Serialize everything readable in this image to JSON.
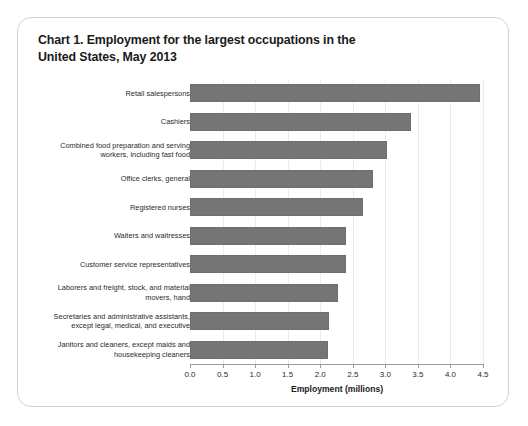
{
  "card": {
    "title_line1": "Chart 1. Employment for the largest occupations in the",
    "title_line2": "United States, May 2013"
  },
  "chart_data": {
    "type": "bar",
    "orientation": "horizontal",
    "title": "Chart 1. Employment for the largest occupations in the United States, May 2013",
    "xlabel": "Employment (millions)",
    "ylabel": "",
    "xlim": [
      0.0,
      4.5
    ],
    "xticks": [
      "0.0",
      "0.5",
      "1.0",
      "1.5",
      "2.0",
      "2.5",
      "3.0",
      "3.5",
      "4.0",
      "4.5"
    ],
    "xtick_values": [
      0.0,
      0.5,
      1.0,
      1.5,
      2.0,
      2.5,
      3.0,
      3.5,
      4.0,
      4.5
    ],
    "grid": "vertical-light",
    "legend": "none",
    "bar_color": "#757575",
    "categories": [
      "Retail salespersons",
      "Cashiers",
      "Combined food preparation and serving workers, including fast food",
      "Office clerks, general",
      "Registered nurses",
      "Waiters and waitresses",
      "Customer service representatives",
      "Laborers and freight, stock, and material movers, hand",
      "Secretaries and administrative assistants, except legal, medical, and executive",
      "Janitors and cleaners, except maids and housekeeping cleaners"
    ],
    "category_lines": [
      [
        "Retail salespersons"
      ],
      [
        "Cashiers"
      ],
      [
        "Combined food preparation and serving",
        "workers, including fast food"
      ],
      [
        "Office clerks, general"
      ],
      [
        "Registered nurses"
      ],
      [
        "Waiters and waitresses"
      ],
      [
        "Customer service representatives"
      ],
      [
        "Laborers and freight, stock, and material",
        "movers, hand"
      ],
      [
        "Secretaries and administrative assistants,",
        "except legal, medical, and executive"
      ],
      [
        "Janitors and cleaners, except maids and",
        "housekeeping cleaners"
      ]
    ],
    "values": [
      4.45,
      3.39,
      3.02,
      2.81,
      2.66,
      2.4,
      2.4,
      2.27,
      2.14,
      2.12
    ]
  }
}
